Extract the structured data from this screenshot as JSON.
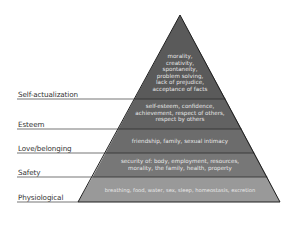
{
  "diagram": {
    "type": "pyramid",
    "levels": [
      {
        "name": "Self-actualization",
        "text": [
          "morality,",
          "creativity,",
          "spontaneity,",
          "problem solving,",
          "lack of prejudice,",
          "acceptance of facts"
        ],
        "color": "#5a5a5a"
      },
      {
        "name": "Esteem",
        "text": [
          "self-esteem, confidence,",
          "achievement, respect of others,",
          "respect by others"
        ],
        "color": "#636363"
      },
      {
        "name": "Love/belonging",
        "text": [
          "friendship, family, sexual intimacy"
        ],
        "color": "#6e6e6e"
      },
      {
        "name": "Safety",
        "text": [
          "security of: body, employment, resources,",
          "morality, the family, health, property"
        ],
        "color": "#7a7a7a"
      },
      {
        "name": "Physiological",
        "text": [
          "breathing, food, water, sex, sleep, homeostasis, excretion"
        ],
        "color": "#9a9a9a"
      }
    ],
    "edge_color": "#1e1e1e",
    "line_color": "#3a3a3a"
  }
}
